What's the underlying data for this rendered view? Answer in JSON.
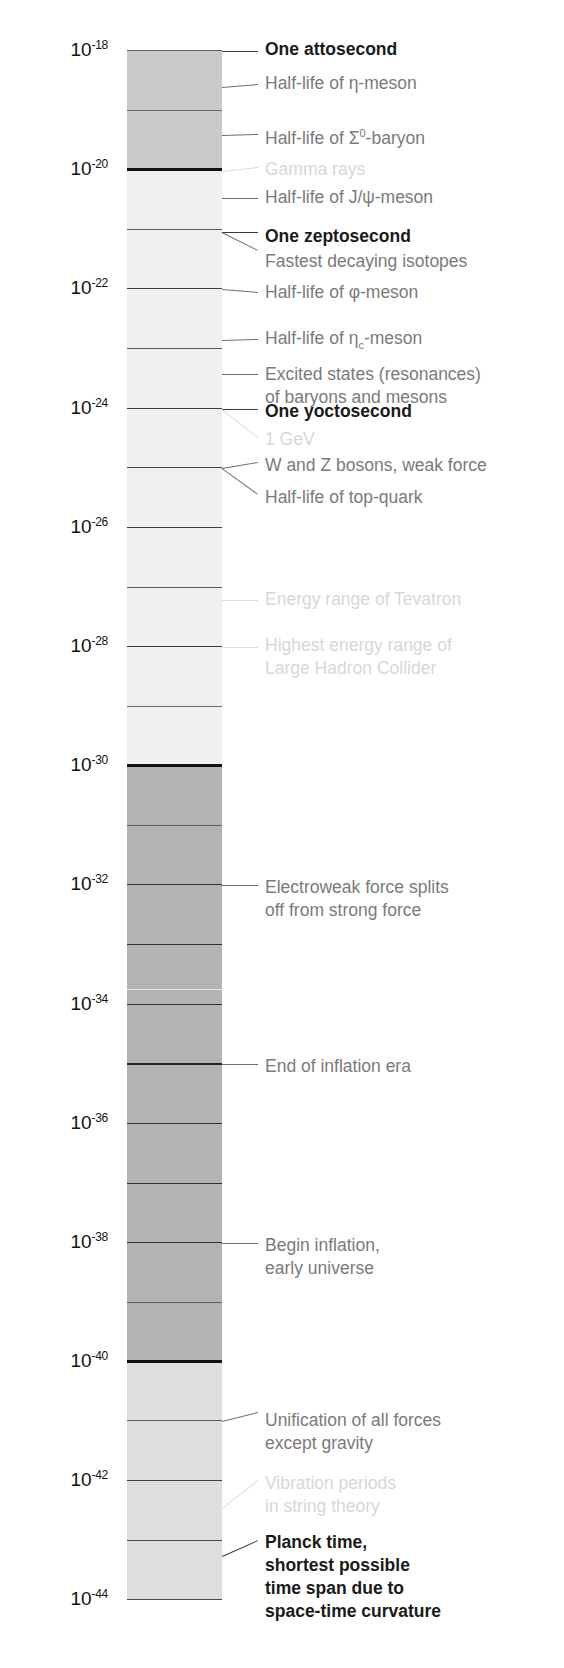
{
  "figure": {
    "kind": "logarithmic-timescale",
    "unit": "seconds",
    "axis_top_exponent": -18,
    "axis_bottom_exponent": -44
  },
  "axis": {
    "base": "10",
    "ticks": [
      {
        "exponent": "-18",
        "y": 51,
        "label": "10",
        "sup": "-18"
      },
      {
        "exponent": "-20",
        "y": 170,
        "label": "10",
        "sup": "-20"
      },
      {
        "exponent": "-22",
        "y": 289,
        "label": "10",
        "sup": "-22"
      },
      {
        "exponent": "-24",
        "y": 409,
        "label": "10",
        "sup": "-24"
      },
      {
        "exponent": "-26",
        "y": 528,
        "label": "10",
        "sup": "-26"
      },
      {
        "exponent": "-28",
        "y": 647,
        "label": "10",
        "sup": "-28"
      },
      {
        "exponent": "-30",
        "y": 766,
        "label": "10",
        "sup": "-30"
      },
      {
        "exponent": "-32",
        "y": 885,
        "label": "10",
        "sup": "-32"
      },
      {
        "exponent": "-34",
        "y": 1005,
        "label": "10",
        "sup": "-34"
      },
      {
        "exponent": "-36",
        "y": 1124,
        "label": "10",
        "sup": "-36"
      },
      {
        "exponent": "-38",
        "y": 1243,
        "label": "10",
        "sup": "-38"
      },
      {
        "exponent": "-40",
        "y": 1362,
        "label": "10",
        "sup": "-40"
      },
      {
        "exponent": "-42",
        "y": 1481,
        "label": "10",
        "sup": "-42"
      },
      {
        "exponent": "-44",
        "y": 1600,
        "label": "10",
        "sup": "-44"
      }
    ]
  },
  "bar": {
    "left": 127,
    "width": 95,
    "top": 51,
    "bottom": 1600,
    "segments": [
      {
        "name": "seg-1e18-1e20",
        "top": 51,
        "height": 120,
        "color": "#c9c9c9"
      },
      {
        "name": "seg-1e20-1e30",
        "top": 171,
        "height": 595,
        "color": "#f0f0f0"
      },
      {
        "name": "seg-1e30-1e40",
        "top": 766,
        "height": 596,
        "color": "#b3b3b3"
      },
      {
        "name": "seg-1e40-1e44",
        "top": 1362,
        "height": 238,
        "color": "#dedede"
      }
    ],
    "gridlines": [
      {
        "y": 51,
        "weight": 1.6,
        "color": "#5a5a5a"
      },
      {
        "y": 111,
        "weight": 1.4,
        "color": "#6a6a6a"
      },
      {
        "y": 170,
        "weight": 3.2,
        "color": "#111111"
      },
      {
        "y": 230,
        "weight": 1.6,
        "color": "#5a5a5a"
      },
      {
        "y": 289,
        "weight": 1.8,
        "color": "#3d3d3d"
      },
      {
        "y": 349,
        "weight": 1.6,
        "color": "#5a5a5a"
      },
      {
        "y": 409,
        "weight": 1.8,
        "color": "#3d3d3d"
      },
      {
        "y": 468,
        "weight": 1.8,
        "color": "#4a4a4a"
      },
      {
        "y": 528,
        "weight": 1.8,
        "color": "#3d3d3d"
      },
      {
        "y": 588,
        "weight": 1.6,
        "color": "#5a5a5a"
      },
      {
        "y": 647,
        "weight": 1.8,
        "color": "#3d3d3d"
      },
      {
        "y": 707,
        "weight": 1.4,
        "color": "#6a6a6a"
      },
      {
        "y": 766,
        "weight": 3.4,
        "color": "#111111"
      },
      {
        "y": 826,
        "weight": 1.4,
        "color": "#5f5f5f"
      },
      {
        "y": 885,
        "weight": 1.8,
        "color": "#2f2f2f"
      },
      {
        "y": 945,
        "weight": 1.8,
        "color": "#2f2f2f"
      },
      {
        "y": 990,
        "weight": 1.6,
        "color": "#e9e9e9"
      },
      {
        "y": 1005,
        "weight": 1.8,
        "color": "#2f2f2f"
      },
      {
        "y": 1064,
        "weight": 2.0,
        "color": "#222222"
      },
      {
        "y": 1124,
        "weight": 1.8,
        "color": "#2f2f2f"
      },
      {
        "y": 1184,
        "weight": 1.8,
        "color": "#2f2f2f"
      },
      {
        "y": 1243,
        "weight": 1.8,
        "color": "#2f2f2f"
      },
      {
        "y": 1303,
        "weight": 1.4,
        "color": "#5f5f5f"
      },
      {
        "y": 1362,
        "weight": 3.4,
        "color": "#111111"
      },
      {
        "y": 1421,
        "weight": 1.6,
        "color": "#5a5a5a"
      },
      {
        "y": 1481,
        "weight": 1.8,
        "color": "#3d3d3d"
      },
      {
        "y": 1541,
        "weight": 1.8,
        "color": "#4a4a4a"
      },
      {
        "y": 1600,
        "weight": 1.8,
        "color": "#4a4a4a"
      }
    ]
  },
  "annotations": [
    {
      "id": "one-attosecond",
      "style": "dark",
      "x": 265,
      "y": 38,
      "lines": [
        "One attosecond"
      ],
      "leader": {
        "x1": 222,
        "y1": 51,
        "x2": 258,
        "y2": 51
      }
    },
    {
      "id": "half-life-eta-meson",
      "style": "mid",
      "x": 265,
      "y": 72,
      "lines": [
        "Half-life of η-meson"
      ],
      "leader": {
        "x1": 222,
        "y1": 87,
        "x2": 258,
        "y2": 84
      }
    },
    {
      "id": "half-life-sigma0-baryon",
      "style": "mid",
      "x": 265,
      "y": 122,
      "lines": [
        "Half-life of Σ⁰-baryon"
      ],
      "leader": {
        "x1": 222,
        "y1": 135,
        "x2": 258,
        "y2": 134
      }
    },
    {
      "id": "gamma-rays",
      "style": "faint",
      "x": 265,
      "y": 158,
      "lines": [
        "Gamma rays"
      ],
      "leader": {
        "x1": 222,
        "y1": 171,
        "x2": 258,
        "y2": 167
      }
    },
    {
      "id": "half-life-jpsi-meson",
      "style": "mid",
      "x": 265,
      "y": 186,
      "lines": [
        "Half-life of J/ψ-meson"
      ],
      "leader": {
        "x1": 222,
        "y1": 198,
        "x2": 258,
        "y2": 198
      }
    },
    {
      "id": "one-zeptosecond",
      "style": "dark",
      "x": 265,
      "y": 225,
      "lines": [
        "One zeptosecond"
      ],
      "leader": {
        "x1": 222,
        "y1": 232,
        "x2": 258,
        "y2": 232
      }
    },
    {
      "id": "fastest-decaying-isotopes",
      "style": "mid",
      "x": 265,
      "y": 250,
      "lines": [
        "Fastest decaying isotopes"
      ],
      "leader": {
        "x1": 222,
        "y1": 232,
        "x2": 258,
        "y2": 250
      }
    },
    {
      "id": "half-life-phi-meson",
      "style": "mid",
      "x": 265,
      "y": 281,
      "lines": [
        "Half-life of φ-meson"
      ],
      "leader": {
        "x1": 222,
        "y1": 289,
        "x2": 258,
        "y2": 292
      }
    },
    {
      "id": "half-life-etac-meson",
      "style": "mid",
      "x": 265,
      "y": 327,
      "lines": [
        "Half-life of ηc-meson"
      ],
      "leader": {
        "x1": 222,
        "y1": 340,
        "x2": 258,
        "y2": 339
      }
    },
    {
      "id": "excited-states-resonances",
      "style": "mid",
      "x": 265,
      "y": 363,
      "lines": [
        "Excited states (resonances)",
        "of baryons and mesons"
      ],
      "leader": {
        "x1": 222,
        "y1": 374,
        "x2": 258,
        "y2": 374
      }
    },
    {
      "id": "one-yoctosecond",
      "style": "dark",
      "x": 265,
      "y": 400,
      "lines": [
        "One yoctosecond"
      ],
      "leader": {
        "x1": 222,
        "y1": 409,
        "x2": 258,
        "y2": 409
      }
    },
    {
      "id": "one-gev",
      "style": "faint",
      "x": 265,
      "y": 428,
      "lines": [
        "1 GeV"
      ],
      "leader": {
        "x1": 222,
        "y1": 409,
        "x2": 258,
        "y2": 437
      }
    },
    {
      "id": "w-and-z-bosons",
      "style": "mid",
      "x": 265,
      "y": 454,
      "lines": [
        "W and Z bosons, weak force"
      ],
      "leader": {
        "x1": 222,
        "y1": 468,
        "x2": 258,
        "y2": 462
      }
    },
    {
      "id": "half-life-top-quark",
      "style": "mid",
      "x": 265,
      "y": 486,
      "lines": [
        "Half-life of top-quark"
      ],
      "leader": {
        "x1": 222,
        "y1": 468,
        "x2": 258,
        "y2": 494
      }
    },
    {
      "id": "energy-range-tevatron",
      "style": "faint",
      "x": 265,
      "y": 588,
      "lines": [
        "Energy range of Tevatron"
      ],
      "leader": {
        "x1": 222,
        "y1": 600,
        "x2": 258,
        "y2": 600
      }
    },
    {
      "id": "highest-energy-lhc",
      "style": "faint",
      "x": 265,
      "y": 634,
      "lines": [
        "Highest energy range of",
        "Large Hadron Collider"
      ],
      "leader": {
        "x1": 222,
        "y1": 647,
        "x2": 258,
        "y2": 647
      }
    },
    {
      "id": "electroweak-force-splits",
      "style": "mid",
      "x": 265,
      "y": 876,
      "lines": [
        "Electroweak force splits",
        "off from strong force"
      ],
      "leader": {
        "x1": 222,
        "y1": 885,
        "x2": 258,
        "y2": 885
      }
    },
    {
      "id": "end-of-inflation-era",
      "style": "mid",
      "x": 265,
      "y": 1055,
      "lines": [
        "End of inflation era"
      ],
      "leader": {
        "x1": 222,
        "y1": 1064,
        "x2": 258,
        "y2": 1064
      }
    },
    {
      "id": "begin-inflation",
      "style": "mid",
      "x": 265,
      "y": 1234,
      "lines": [
        "Begin inflation,",
        "early universe"
      ],
      "leader": {
        "x1": 222,
        "y1": 1243,
        "x2": 258,
        "y2": 1243
      }
    },
    {
      "id": "unification-of-forces",
      "style": "mid",
      "x": 265,
      "y": 1409,
      "lines": [
        "Unification of all forces",
        "except gravity"
      ],
      "leader": {
        "x1": 222,
        "y1": 1421,
        "x2": 258,
        "y2": 1412
      }
    },
    {
      "id": "vibration-periods-string-theory",
      "style": "faint",
      "x": 265,
      "y": 1472,
      "lines": [
        "Vibration periods",
        "in string theory"
      ],
      "leader": {
        "x1": 222,
        "y1": 1508,
        "x2": 258,
        "y2": 1480
      }
    },
    {
      "id": "planck-time",
      "style": "dark",
      "x": 265,
      "y": 1531,
      "lines": [
        "Planck time,",
        "shortest possible",
        "time span due to",
        "space-time curvature"
      ],
      "leader": {
        "x1": 222,
        "y1": 1556,
        "x2": 258,
        "y2": 1540
      }
    }
  ]
}
